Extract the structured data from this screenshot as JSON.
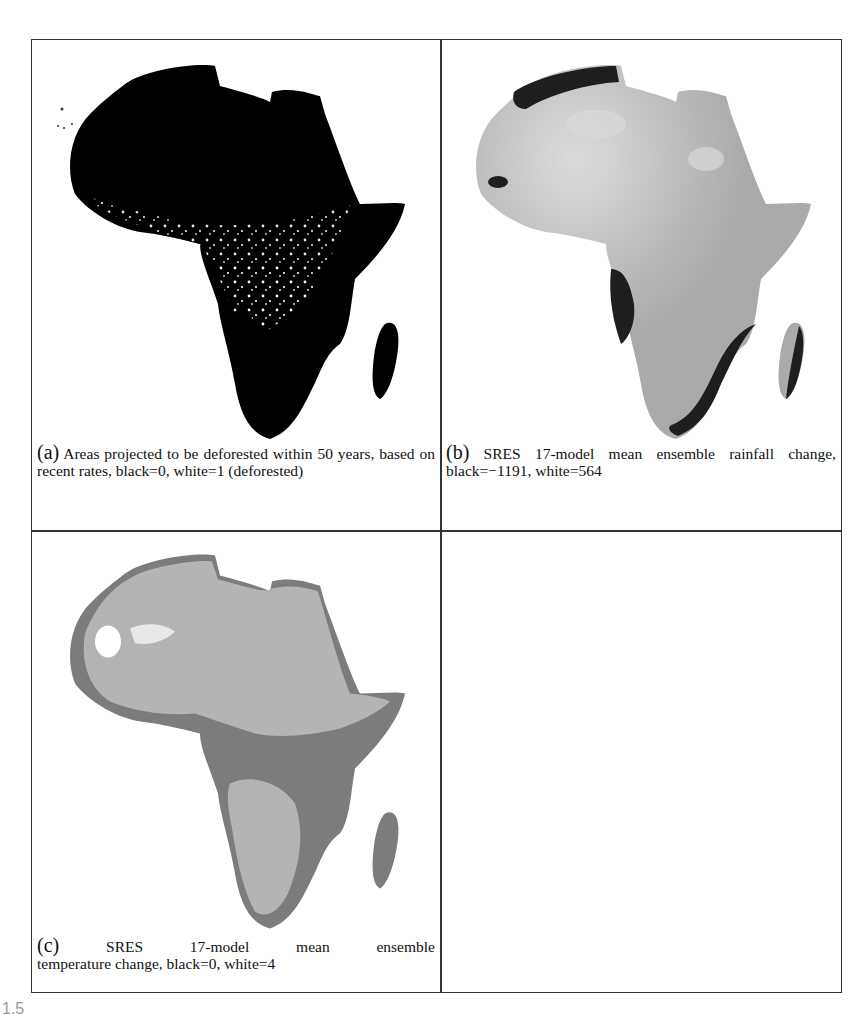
{
  "figure": {
    "label_partial": "1.5",
    "panels": [
      {
        "id": "a",
        "tag": "(a)",
        "caption": "Areas projected to be deforested within 50 years, based on recent rates, black=0, white=1 (deforested)",
        "map": {
          "region": "Africa",
          "style": "binary",
          "black": "0",
          "white": "1 (deforested)"
        }
      },
      {
        "id": "b",
        "tag": "(b)",
        "caption": "SRES 17-model mean ensemble rainfall change, black=−1191, white=564",
        "map": {
          "region": "Africa",
          "style": "grayscale",
          "black": "-1191",
          "white": "564"
        }
      },
      {
        "id": "c",
        "tag": "(c)",
        "caption_line1": "SRES 17-model mean ensemble",
        "caption_line2": "temperature change, black=0, white=4",
        "map": {
          "region": "Africa",
          "style": "grayscale",
          "black": "0",
          "white": "4"
        }
      },
      {
        "id": "d",
        "empty": true
      }
    ]
  },
  "colors": {
    "border": "#333333",
    "panel_a_land": "#000000",
    "panel_b_land": "#a9a9a9",
    "panel_b_dark": "#1e1e1e",
    "panel_c_light": "#b4b4b4",
    "panel_c_dark": "#7c7c7c"
  }
}
